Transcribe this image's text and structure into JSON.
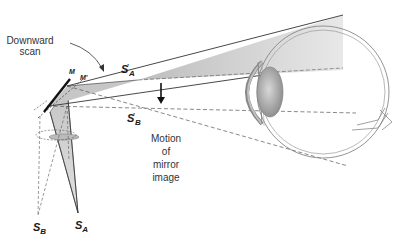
{
  "figure": {
    "labels": {
      "downward_scan": [
        "Downward",
        "scan"
      ],
      "motion_of_mirror_image": [
        "Motion",
        "of",
        "mirror",
        "image"
      ],
      "mirror_m": "M",
      "mirror_m_prime": "M'",
      "s_a_prime": {
        "base": "S",
        "sup": "'",
        "sub": "A"
      },
      "s_b_prime": {
        "base": "S",
        "sup": "'",
        "sub": "B"
      },
      "s_a": {
        "base": "S",
        "sub": "A"
      },
      "s_b": {
        "base": "S",
        "sub": "B"
      }
    },
    "colors": {
      "beam_fill": "#c8c8c8",
      "beam_fill_light": "#e4e4e4",
      "line": "#333333",
      "dashed": "#555555",
      "eye_outline": "#888888",
      "lens": "#9a9a9a",
      "mirror": "#111111"
    }
  }
}
